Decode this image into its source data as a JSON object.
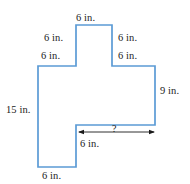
{
  "figure": {
    "kind": "composite-rectilinear-polygon",
    "units": "in.",
    "stroke_color": "#5b9bd5",
    "fill_color": "#ffffff",
    "label_color": "#1a1a1a",
    "labels": {
      "top": "6 in.",
      "notch_left_upper": "6 in.",
      "notch_left_lower": "6 in.",
      "notch_right_upper": "6 in.",
      "notch_right_lower": "6 in.",
      "right_side": "9 in.",
      "left_side": "15 in.",
      "bottom_inner": "6 in.",
      "bottom": "6 in.",
      "unknown": "?"
    },
    "outline_points": "76,25 112,25 112,66 155,66 155,125 76,125 76,167 38,167 38,66 76,66",
    "dimension_arrow": {
      "x1": 78,
      "x2": 155,
      "y": 132,
      "label": "?"
    }
  }
}
